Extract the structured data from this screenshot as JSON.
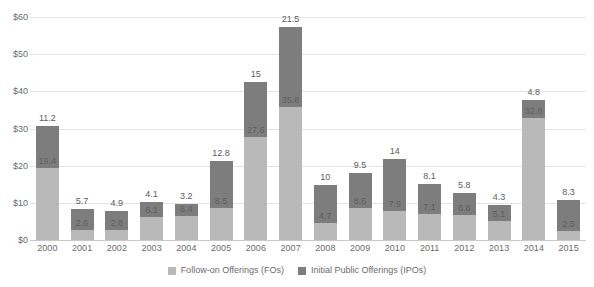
{
  "chart_data": {
    "type": "bar",
    "stacked": true,
    "title": "",
    "subtitle": "",
    "xlabel": "",
    "ylabel": "",
    "ylim": [
      0,
      60
    ],
    "ytick_labels": [
      "$0",
      "$10",
      "$20",
      "$30",
      "$40",
      "$50",
      "$60"
    ],
    "ytick_values": [
      0,
      10,
      20,
      30,
      40,
      50,
      60
    ],
    "grid": true,
    "legend_position": "bottom",
    "categories": [
      "2000",
      "2001",
      "2002",
      "2003",
      "2004",
      "2005",
      "2006",
      "2007",
      "2008",
      "2009",
      "2010",
      "2011",
      "2012",
      "2013",
      "2014",
      "2015"
    ],
    "series": [
      {
        "name": "Follow-on Offerings (FOs)",
        "color": "#b9b9b9",
        "values": [
          19.4,
          2.6,
          2.8,
          6.1,
          6.4,
          8.5,
          27.6,
          35.8,
          4.7,
          8.6,
          7.9,
          7.1,
          6.8,
          5.1,
          32.8,
          2.5
        ]
      },
      {
        "name": "Initial Public Offerings (IPOs)",
        "color": "#7d7d7d",
        "values": [
          11.2,
          5.7,
          4.9,
          4.1,
          3.2,
          12.8,
          15,
          21.5,
          10,
          9.5,
          14,
          8.1,
          5.8,
          4.3,
          4.8,
          8.3
        ]
      }
    ],
    "totals": [
      30.6,
      8.3,
      7.7,
      10.2,
      9.6,
      21.3,
      42.6,
      57.3,
      14.7,
      18.1,
      21.9,
      15.2,
      12.6,
      9.4,
      37.6,
      10.8
    ]
  },
  "legend": {
    "items": [
      {
        "label": "Follow-on Offerings (FOs)",
        "swatch": "fo"
      },
      {
        "label": "Initial Public Offerings (IPOs)",
        "swatch": "ipo"
      }
    ]
  }
}
